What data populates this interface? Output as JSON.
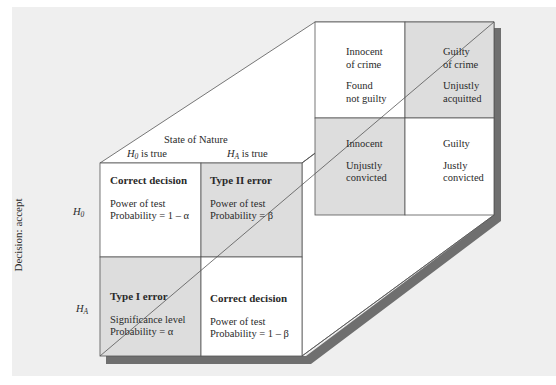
{
  "colors": {
    "background": "#efefef",
    "cell_white": "#ffffff",
    "cell_shaded": "#dddddd",
    "shadow": "#6f6f6f",
    "line": "#555555",
    "text": "#2a2a2a"
  },
  "front_face": {
    "column_header": "State of Nature",
    "columns": [
      {
        "symbol": "H",
        "sub": "0",
        "suffix": " is true"
      },
      {
        "symbol": "H",
        "sub": "A",
        "suffix": " is true"
      }
    ],
    "row_axis_label": "Decision: accept",
    "rows": [
      {
        "symbol": "H",
        "sub": "0"
      },
      {
        "symbol": "H",
        "sub": "A"
      }
    ],
    "cells": [
      {
        "title": "Correct decision",
        "line1": "Power of test",
        "line2": "Probability = 1 – α",
        "shaded": false
      },
      {
        "title": "Type II error",
        "line1": "Power of test",
        "line2": "Probability = β",
        "shaded": true
      },
      {
        "title": "Type I error",
        "line1": "Significance level",
        "line2": "Probability = α",
        "shaded": true
      },
      {
        "title": "Correct decision",
        "line1": "Power of test",
        "line2": "Probability = 1 – β",
        "shaded": false
      }
    ]
  },
  "back_face": {
    "cells": [
      {
        "line1": "Innocent",
        "line2": "of crime",
        "line3": "Found",
        "line4": "not guilty",
        "shaded": false
      },
      {
        "line1": "Guilty",
        "line2": "of crime",
        "line3": "Unjustly",
        "line4": "acquitted",
        "shaded": true
      },
      {
        "line1": "Innocent",
        "line2": "",
        "line3": "Unjustly",
        "line4": "convicted",
        "shaded": true
      },
      {
        "line1": "Guilty",
        "line2": "",
        "line3": "Justly",
        "line4": "convicted",
        "shaded": false
      }
    ]
  }
}
